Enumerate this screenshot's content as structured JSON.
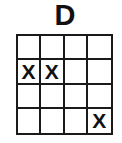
{
  "title": "D",
  "grid": {
    "rows": 4,
    "cols": 4,
    "cells": [
      [
        "",
        "",
        "",
        ""
      ],
      [
        "X",
        "X",
        "",
        ""
      ],
      [
        "",
        "",
        "",
        ""
      ],
      [
        "",
        "",
        "",
        "X"
      ]
    ]
  }
}
